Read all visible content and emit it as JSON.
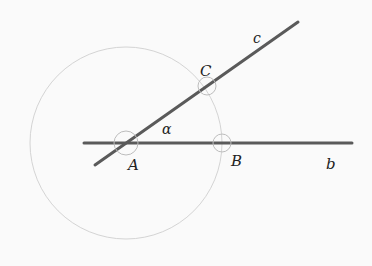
{
  "diagram": {
    "background": "#fafafa",
    "colors": {
      "line": "#5a5a5a",
      "circle": "#d4d4d4",
      "marker": "#bdbdbd",
      "text": "#222222"
    },
    "points": {
      "A": {
        "label": "A",
        "x": 126,
        "y": 143
      },
      "B": {
        "label": "B",
        "x": 222,
        "y": 143
      },
      "C": {
        "label": "C",
        "x": 207,
        "y": 86
      }
    },
    "lines": {
      "b": {
        "label": "b",
        "x1": 84,
        "y1": 143,
        "x2": 352,
        "y2": 143
      },
      "c": {
        "label": "c",
        "x1": 95,
        "y1": 165,
        "x2": 298,
        "y2": 22
      }
    },
    "circle": {
      "cx": 126,
      "cy": 143,
      "r": 96
    },
    "angle": {
      "label": "α"
    },
    "labels": {
      "A": "A",
      "B": "B",
      "C": "C",
      "b": "b",
      "c": "c",
      "alpha": "α"
    }
  }
}
